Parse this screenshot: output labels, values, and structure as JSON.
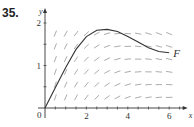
{
  "problem_number": "35.",
  "chart_data": {
    "type": "line",
    "title": "",
    "xlabel": "x",
    "ylabel": "y",
    "xlim": [
      0,
      6.7
    ],
    "ylim": [
      0,
      2.1
    ],
    "x_ticks": [
      2,
      4,
      6
    ],
    "y_ticks": [
      1,
      2
    ],
    "origin_label": "0",
    "series": [
      {
        "name": "F",
        "x": [
          0,
          0.5,
          1,
          1.5,
          2,
          2.5,
          3,
          3.5,
          4,
          4.5,
          5,
          5.5,
          6
        ],
        "values": [
          0,
          0.48,
          0.95,
          1.38,
          1.68,
          1.83,
          1.85,
          1.8,
          1.68,
          1.55,
          1.42,
          1.33,
          1.3
        ]
      }
    ],
    "direction_field": true
  }
}
